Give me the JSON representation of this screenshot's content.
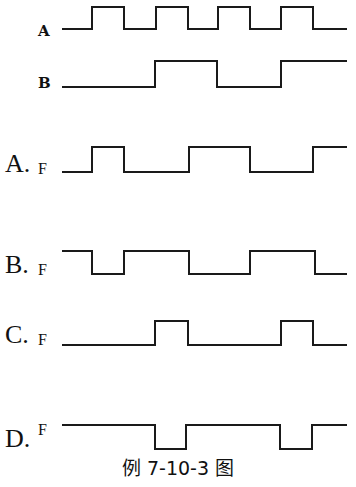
{
  "caption": "例 7-10-3 图",
  "stroke_color": "#1a1a1a",
  "inputs": [
    {
      "id": "A",
      "label": "A",
      "label_x": 38,
      "label_y": 36,
      "y_high": 7,
      "y_low": 29,
      "start_x": 62,
      "end_x": 347,
      "initial": 0,
      "edges": [
        92,
        124,
        156,
        188,
        218,
        250,
        281,
        313
      ]
    },
    {
      "id": "B",
      "label": "B",
      "label_x": 38,
      "label_y": 88,
      "y_high": 61,
      "y_low": 87,
      "start_x": 62,
      "end_x": 347,
      "initial": 0,
      "edges": [
        155,
        217,
        281
      ]
    }
  ],
  "options": [
    {
      "id": "A",
      "label": "A.",
      "f_label": "F",
      "f_position": "subscript",
      "label_x": 5,
      "label_y": 172,
      "y_high": 147,
      "y_low": 172,
      "start_x": 62,
      "end_x": 347,
      "initial": 0,
      "edges": [
        92,
        124,
        189,
        250,
        313
      ]
    },
    {
      "id": "B",
      "label": "B.",
      "f_label": "F",
      "f_position": "subscript",
      "label_x": 5,
      "label_y": 273,
      "y_high": 251,
      "y_low": 274,
      "start_x": 62,
      "end_x": 347,
      "initial": 1,
      "edges": [
        92,
        124,
        189,
        250,
        315
      ]
    },
    {
      "id": "C",
      "label": "C.",
      "f_label": "F",
      "f_position": "subscript",
      "label_x": 5,
      "label_y": 343,
      "y_high": 321,
      "y_low": 345,
      "start_x": 62,
      "end_x": 347,
      "initial": 0,
      "edges": [
        155,
        188,
        281,
        313
      ]
    },
    {
      "id": "D",
      "label": "D.",
      "f_label": "F",
      "f_position": "superscript",
      "label_x": 5,
      "label_y": 447,
      "y_high": 425,
      "y_low": 449,
      "start_x": 62,
      "end_x": 347,
      "initial": 1,
      "edges": [
        155,
        186,
        280,
        312
      ]
    }
  ]
}
